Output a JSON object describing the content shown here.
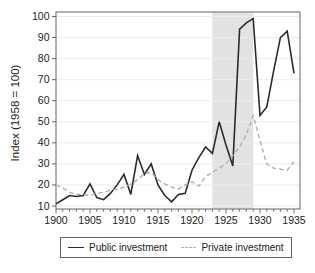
{
  "chart_data": {
    "type": "line",
    "title": "",
    "xlabel": "",
    "ylabel": "Index (1958 = 100)",
    "xlim": [
      1900,
      1935
    ],
    "ylim": [
      10,
      100
    ],
    "xticks_major": [
      1900,
      1905,
      1910,
      1915,
      1920,
      1925,
      1930,
      1935
    ],
    "xticks_minor_step": 1,
    "yticks": [
      10,
      20,
      30,
      40,
      50,
      60,
      70,
      80,
      90,
      100
    ],
    "grid": true,
    "legend_position": "bottom",
    "shaded_region": {
      "from": 1923,
      "to": 1929,
      "color": "#e2e2e2"
    },
    "x": [
      1900,
      1901,
      1902,
      1903,
      1904,
      1905,
      1906,
      1907,
      1908,
      1909,
      1910,
      1911,
      1912,
      1913,
      1914,
      1915,
      1916,
      1917,
      1918,
      1919,
      1920,
      1921,
      1922,
      1923,
      1924,
      1925,
      1926,
      1927,
      1928,
      1929,
      1930,
      1931,
      1932,
      1933,
      1934,
      1935
    ],
    "series": [
      {
        "name": "Public investment",
        "style": "solid",
        "color": "#2b2b2b",
        "values": [
          11,
          13,
          15,
          14.5,
          15,
          20.5,
          14,
          13,
          16,
          20,
          25,
          15.5,
          34,
          25,
          30,
          20,
          15,
          12,
          15.5,
          16,
          27,
          33,
          38,
          35,
          50,
          39,
          29,
          94,
          97,
          99,
          53,
          57,
          74,
          90,
          93,
          73
        ]
      },
      {
        "name": "Private investment",
        "style": "dashed",
        "color": "#b0b0b0",
        "values": [
          20,
          18.5,
          16.5,
          15.5,
          15.5,
          15,
          16,
          16.5,
          17.5,
          18,
          19,
          20.5,
          22.5,
          25.5,
          26,
          22.5,
          20.5,
          19,
          18,
          20,
          21.5,
          19.5,
          24,
          26,
          28,
          30,
          34,
          38,
          44,
          53,
          41,
          30,
          28,
          27.5,
          27,
          31
        ]
      }
    ]
  }
}
